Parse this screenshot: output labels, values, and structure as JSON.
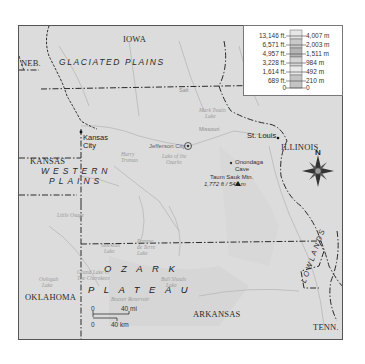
{
  "map": {
    "title": "Missouri physical regions",
    "states": {
      "iowa": "IOWA",
      "nebraska": "NEB.",
      "kansas": "KANSAS",
      "illinois": "ILLINOIS",
      "oklahoma": "OKLAHOMA",
      "arkansas": "ARKANSAS",
      "tennessee": "TENN."
    },
    "regions": {
      "glaciated_plains": "GLACIATED   PLAINS",
      "western_plains_1": "WESTERN",
      "western_plains_2": "PLAINS",
      "ozark_1": "OZARK",
      "ozark_2": "PLATEAU",
      "lowlands": "LOWLANDS"
    },
    "cities": {
      "kansas_city_1": "Kansas",
      "kansas_city_2": "City",
      "jefferson_city": "Jefferson City",
      "st_louis": "St. Louis"
    },
    "features": {
      "onondaga_1": "Onondaga",
      "onondaga_2": "Cave",
      "taum_sauk_1": "Taum Sauk Mtn.",
      "taum_sauk_2": "1,772 ft / 540 m"
    },
    "faint_labels": {
      "missouri_river": "Missouri",
      "lake_ozarks_1": "Lake of the",
      "lake_ozarks_2": "Ozarks",
      "harry_truman_1": "Harry",
      "harry_truman_2": "Truman",
      "little_osage": "Little Osage",
      "stockton_1": "Stockton",
      "stockton_2": "Lake",
      "pomme_1": "Pomme",
      "pomme_2": "de Terre",
      "pomme_3": "Lake",
      "grand_lake_1": "Grand Lake O'",
      "grand_lake_2": "The Cherokees",
      "oologah_1": "Oologah",
      "oologah_2": "Lake",
      "bull_shoals_1": "Bull Shoals",
      "bull_shoals_2": "Lake",
      "beaver": "Beaver Reservoir",
      "mark_twain_1": "Mark Twain",
      "mark_twain_2": "Lake",
      "salt": "Salt"
    },
    "compass": {
      "north_label": "N"
    },
    "scale": {
      "mi_zero": "0",
      "mi_label": "40 mi",
      "km_zero": "0",
      "km_label": "40 km"
    }
  },
  "legend": {
    "rows": [
      {
        "ft": "13,146 ft.",
        "m": "4,007 m"
      },
      {
        "ft": "6,571 ft.",
        "m": "2,003 m"
      },
      {
        "ft": "4,957 ft.",
        "m": "1,511 m"
      },
      {
        "ft": "3,228 ft.",
        "m": "984 m"
      },
      {
        "ft": "1,614 ft.",
        "m": "492 m"
      },
      {
        "ft": "689 ft.",
        "m": "210 m"
      },
      {
        "ft": "0",
        "m": "0"
      }
    ],
    "bar_colors": [
      "#e6e6e6",
      "#c9c9c9",
      "#b4b4b4",
      "#d4d4d4",
      "#e8e8e8",
      "#c4c4c4"
    ]
  }
}
